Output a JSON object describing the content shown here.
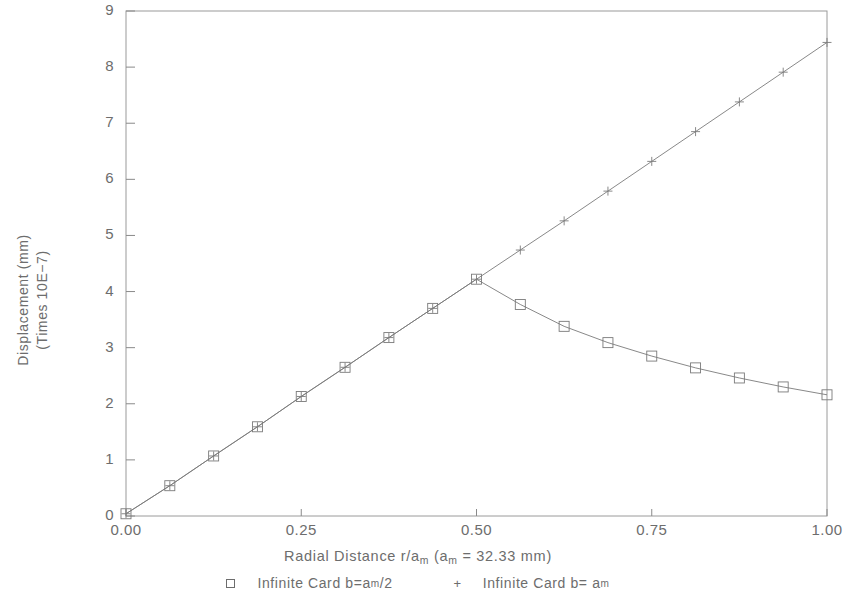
{
  "chart_data": {
    "type": "line",
    "title": "",
    "xlabel": "Radial Distance r/a_m (a_m = 32.33 mm)",
    "ylabel": "Displacement (mm) (Times 10E-7)",
    "xlim": [
      0.0,
      1.0
    ],
    "ylim": [
      0,
      9
    ],
    "xticks": [
      "0.00",
      "0.25",
      "0.50",
      "0.75",
      "1.00"
    ],
    "xtick_values": [
      0.0,
      0.25,
      0.5,
      0.75,
      1.0
    ],
    "yticks": [
      "0",
      "1",
      "2",
      "3",
      "4",
      "5",
      "6",
      "7",
      "8",
      "9"
    ],
    "ytick_values": [
      0,
      1,
      2,
      3,
      4,
      5,
      6,
      7,
      8,
      9
    ],
    "grid": false,
    "legend_position": "below-axes",
    "series": [
      {
        "name": "Infinite Card b=a_m/2",
        "marker": "square",
        "x": [
          0.0,
          0.0625,
          0.125,
          0.1875,
          0.25,
          0.3125,
          0.375,
          0.4375,
          0.5,
          0.5625,
          0.625,
          0.6875,
          0.75,
          0.8125,
          0.875,
          0.9375,
          1.0
        ],
        "values": [
          0.04,
          0.54,
          1.07,
          1.59,
          2.13,
          2.65,
          3.18,
          3.7,
          4.22,
          3.77,
          3.38,
          3.09,
          2.85,
          2.64,
          2.46,
          2.3,
          2.16
        ]
      },
      {
        "name": "Infinite Card b=a_m",
        "marker": "plus",
        "x": [
          0.0,
          0.0625,
          0.125,
          0.1875,
          0.25,
          0.3125,
          0.375,
          0.4375,
          0.5,
          0.5625,
          0.625,
          0.6875,
          0.75,
          0.8125,
          0.875,
          0.9375,
          1.0
        ],
        "values": [
          0.04,
          0.54,
          1.07,
          1.59,
          2.13,
          2.65,
          3.18,
          3.7,
          4.22,
          4.74,
          5.26,
          5.79,
          6.32,
          6.85,
          7.38,
          7.91,
          8.44
        ]
      }
    ]
  },
  "axes": {
    "y_label_line1": "Displacement (mm)",
    "y_label_line2": "(Times 10E−7)",
    "x_label_prefix": "Radial Distance r/a",
    "x_label_sub1": "m",
    "x_label_mid": " (a",
    "x_label_sub2": "m",
    "x_label_suffix": " = 32.33 mm)"
  },
  "legend": {
    "entry1": {
      "symbol": "square",
      "text_prefix": "Infinite Card b=a",
      "text_sub": "m",
      "text_suffix": "/2"
    },
    "entry2": {
      "symbol": "+",
      "text_prefix": "Infinite Card b= a",
      "text_sub": "m",
      "text_suffix": ""
    }
  },
  "colors": {
    "line": "#7a7a7a",
    "axis": "#8a8a8a",
    "text": "#6d6d6d",
    "background": "#ffffff"
  }
}
